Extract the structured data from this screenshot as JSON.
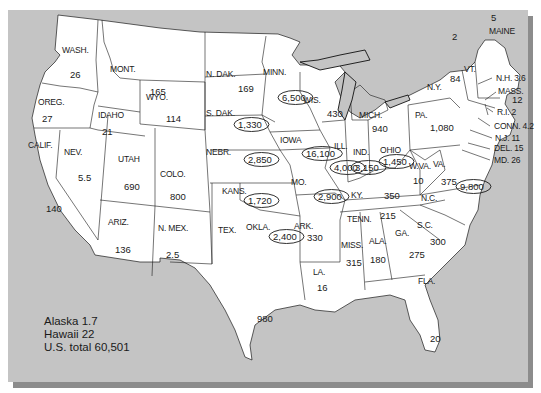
{
  "map": {
    "type": "choropleth-style labeled map",
    "region": "Contiguous United States",
    "colors": {
      "background": "#c4c4c4",
      "shadow": "#8c8c8c",
      "land": "#ffffff",
      "border": "#1a1a1a"
    },
    "states": [
      {
        "abbr": "WASH.",
        "value": "26",
        "circled": false
      },
      {
        "abbr": "OREG.",
        "value": "27",
        "circled": false
      },
      {
        "abbr": "CALIF.",
        "value": "140",
        "circled": false
      },
      {
        "abbr": "NEV.",
        "value": "5.5",
        "circled": false
      },
      {
        "abbr": "IDAHO",
        "value": "21",
        "circled": false
      },
      {
        "abbr": "MONT.",
        "value": "165",
        "circled": false
      },
      {
        "abbr": "WYO.",
        "value": "114",
        "circled": false
      },
      {
        "abbr": "UTAH",
        "value": "690",
        "circled": false
      },
      {
        "abbr": "COLO.",
        "value": "800",
        "circled": false
      },
      {
        "abbr": "ARIZ.",
        "value": "136",
        "circled": false
      },
      {
        "abbr": "N. MEX.",
        "value": "2.5",
        "circled": false
      },
      {
        "abbr": "N. DAK.",
        "value": "169",
        "circled": false
      },
      {
        "abbr": "S. DAK.",
        "value": "1,330",
        "circled": true
      },
      {
        "abbr": "NEBR.",
        "value": "2,850",
        "circled": true
      },
      {
        "abbr": "KANS.",
        "value": "1,720",
        "circled": true
      },
      {
        "abbr": "OKLA.",
        "value": "2,400",
        "circled": true
      },
      {
        "abbr": "TEX.",
        "value": "980",
        "circled": false
      },
      {
        "abbr": "MINN.",
        "value": "6,500",
        "circled": true
      },
      {
        "abbr": "IOWA",
        "value": "16,100",
        "circled": true
      },
      {
        "abbr": "MO.",
        "value": "2,900",
        "circled": true
      },
      {
        "abbr": "ARK.",
        "value": "330",
        "circled": false
      },
      {
        "abbr": "LA.",
        "value": "16",
        "circled": false
      },
      {
        "abbr": "WIS.",
        "value": "430",
        "circled": false
      },
      {
        "abbr": "ILL.",
        "value": "4,000",
        "circled": true
      },
      {
        "abbr": "MICH.",
        "value": "940",
        "circled": false
      },
      {
        "abbr": "IND.",
        "value": "3,150",
        "circled": true
      },
      {
        "abbr": "OHIO",
        "value": "1,450",
        "circled": true
      },
      {
        "abbr": "KY.",
        "value": "350",
        "circled": false
      },
      {
        "abbr": "TENN.",
        "value": "215",
        "circled": false
      },
      {
        "abbr": "MISS.",
        "value": "315",
        "circled": false
      },
      {
        "abbr": "ALA.",
        "value": "180",
        "circled": false
      },
      {
        "abbr": "GA.",
        "value": "275",
        "circled": false
      },
      {
        "abbr": "FLA.",
        "value": "20",
        "circled": false
      },
      {
        "abbr": "S.C.",
        "value": "300",
        "circled": false
      },
      {
        "abbr": "N.C.",
        "value": "9,800",
        "circled": true
      },
      {
        "abbr": "VA.",
        "value": "375",
        "circled": false
      },
      {
        "abbr": "W.VA.",
        "value": "10",
        "circled": false
      },
      {
        "abbr": "PA.",
        "value": "1,080",
        "circled": false
      },
      {
        "abbr": "N.Y.",
        "value": "84",
        "circled": false
      },
      {
        "abbr": "VT.",
        "value": "2",
        "circled": false
      },
      {
        "abbr": "MAINE",
        "value": "5",
        "circled": false
      },
      {
        "abbr": "N.H.",
        "value": "3.6",
        "circled": false
      },
      {
        "abbr": "MASS.",
        "value": "12",
        "circled": false
      },
      {
        "abbr": "R.I.",
        "value": "2",
        "circled": false
      },
      {
        "abbr": "CONN.",
        "value": "4.2",
        "circled": false
      },
      {
        "abbr": "N.J.",
        "value": "11",
        "circled": false
      },
      {
        "abbr": "DEL.",
        "value": "15",
        "circled": false
      },
      {
        "abbr": "MD.",
        "value": "26",
        "circled": false
      }
    ]
  },
  "legend": {
    "alaska": "Alaska 1.7",
    "hawaii": "Hawaii 22",
    "total": "U.S. total 60,501"
  }
}
